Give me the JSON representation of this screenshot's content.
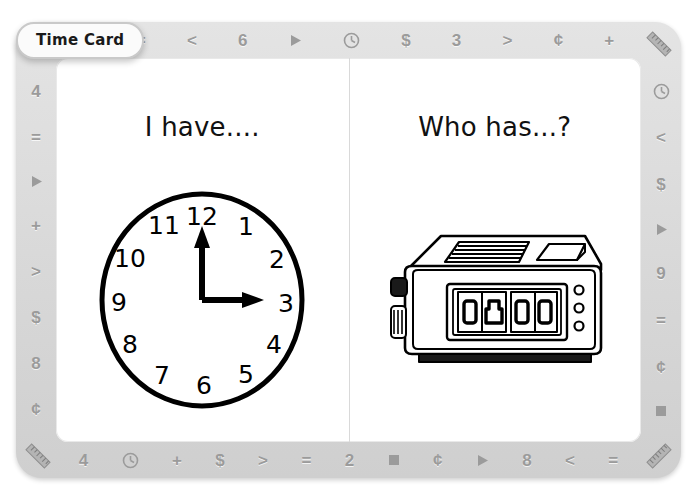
{
  "tab": {
    "label": "Time Card"
  },
  "card": {
    "border_color": "#dedede",
    "symbol_color": "#9b9b9b",
    "page_color": "#ffffff",
    "ink_color": "#000000"
  },
  "borders": {
    "top": [
      {
        "name": "square-icon",
        "type": "icon",
        "icon": "square"
      },
      {
        "name": "equals-sign",
        "type": "glyph",
        "glyph": "="
      },
      {
        "name": "less-than-sign",
        "type": "glyph",
        "glyph": "<"
      },
      {
        "name": "number-six",
        "type": "glyph",
        "glyph": "6"
      },
      {
        "name": "triangle-right-icon",
        "type": "icon",
        "icon": "triangle-right"
      },
      {
        "name": "clock-icon",
        "type": "icon",
        "icon": "clock"
      },
      {
        "name": "dollar-sign",
        "type": "glyph",
        "glyph": "$"
      },
      {
        "name": "number-three",
        "type": "glyph",
        "glyph": "3"
      },
      {
        "name": "greater-than-sign",
        "type": "glyph",
        "glyph": ">"
      },
      {
        "name": "cent-sign",
        "type": "glyph",
        "glyph": "¢"
      },
      {
        "name": "plus-sign",
        "type": "glyph",
        "glyph": "+"
      }
    ],
    "right": [
      {
        "name": "clock-icon",
        "type": "icon",
        "icon": "clock"
      },
      {
        "name": "less-than-sign",
        "type": "glyph",
        "glyph": "<"
      },
      {
        "name": "dollar-sign",
        "type": "glyph",
        "glyph": "$"
      },
      {
        "name": "triangle-right-icon",
        "type": "icon",
        "icon": "triangle-right"
      },
      {
        "name": "number-nine",
        "type": "glyph",
        "glyph": "9"
      },
      {
        "name": "equals-sign",
        "type": "glyph",
        "glyph": "="
      },
      {
        "name": "cent-sign",
        "type": "glyph",
        "glyph": "¢"
      },
      {
        "name": "square-icon",
        "type": "icon",
        "icon": "square"
      }
    ],
    "bottom": [
      {
        "name": "number-four",
        "type": "glyph",
        "glyph": "4"
      },
      {
        "name": "clock-icon",
        "type": "icon",
        "icon": "clock"
      },
      {
        "name": "plus-sign",
        "type": "glyph",
        "glyph": "+"
      },
      {
        "name": "dollar-sign",
        "type": "glyph",
        "glyph": "$"
      },
      {
        "name": "greater-than-sign",
        "type": "glyph",
        "glyph": ">"
      },
      {
        "name": "equals-sign",
        "type": "glyph",
        "glyph": "="
      },
      {
        "name": "number-two",
        "type": "glyph",
        "glyph": "2"
      },
      {
        "name": "square-icon",
        "type": "icon",
        "icon": "square"
      },
      {
        "name": "cent-sign",
        "type": "glyph",
        "glyph": "¢"
      },
      {
        "name": "triangle-right-icon",
        "type": "icon",
        "icon": "triangle-right"
      },
      {
        "name": "number-eight",
        "type": "glyph",
        "glyph": "8"
      },
      {
        "name": "less-than-sign",
        "type": "glyph",
        "glyph": "<"
      },
      {
        "name": "equals-sign",
        "type": "glyph",
        "glyph": "="
      }
    ],
    "left": [
      {
        "name": "number-four",
        "type": "glyph",
        "glyph": "4"
      },
      {
        "name": "equals-sign",
        "type": "glyph",
        "glyph": "="
      },
      {
        "name": "triangle-right-icon",
        "type": "icon",
        "icon": "triangle-right"
      },
      {
        "name": "plus-sign",
        "type": "glyph",
        "glyph": "+"
      },
      {
        "name": "greater-than-sign",
        "type": "glyph",
        "glyph": ">"
      },
      {
        "name": "dollar-sign",
        "type": "glyph",
        "glyph": "$"
      },
      {
        "name": "number-eight",
        "type": "glyph",
        "glyph": "8"
      },
      {
        "name": "cent-sign",
        "type": "glyph",
        "glyph": "¢"
      }
    ],
    "corners": [
      "ruler-icon",
      "ruler-icon",
      "ruler-icon",
      "ruler-icon"
    ]
  },
  "left_page": {
    "heading": "I have....",
    "illustration": "analog-clock",
    "clock": {
      "numerals": [
        "12",
        "1",
        "2",
        "3",
        "4",
        "5",
        "6",
        "7",
        "8",
        "9",
        "10",
        "11"
      ],
      "hour_hand_points_to": "3",
      "minute_hand_points_to": "12",
      "time_shown": "3:00"
    }
  },
  "right_page": {
    "heading": "Who has...?",
    "illustration": "digital-clock-radio",
    "digital_clock": {
      "digit_panels": 4,
      "display_blank": true,
      "indicator_lights": 3,
      "side_knobs": 2
    }
  }
}
